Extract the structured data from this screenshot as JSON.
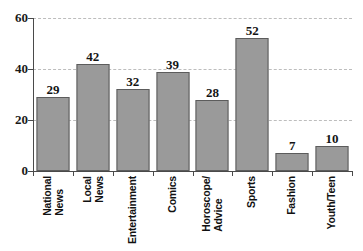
{
  "chart_data": {
    "type": "bar",
    "title": "",
    "subtitle": "",
    "xlabel": "",
    "ylabel": "",
    "ylim": [
      0,
      60
    ],
    "yticks": [
      0,
      20,
      40,
      60
    ],
    "ytick_labels": [
      "0",
      "20",
      "40",
      "60"
    ],
    "grid": true,
    "grid_axis": "y",
    "legend": false,
    "legend_position": "none",
    "orientation": "vertical",
    "value_labels": true,
    "categories": [
      "National News",
      "Local News",
      "Entertainment",
      "Comics",
      "Horoscope/ Advice",
      "Sports",
      "Fashion",
      "Youth/Teen"
    ],
    "category_lines": [
      [
        "National",
        "News"
      ],
      [
        "Local",
        "News"
      ],
      [
        "Entertainment"
      ],
      [
        "Comics"
      ],
      [
        "Horoscope/",
        "Advice"
      ],
      [
        "Sports"
      ],
      [
        "Fashion"
      ],
      [
        "Youth/Teen"
      ]
    ],
    "values": [
      29,
      42,
      32,
      39,
      28,
      52,
      7,
      10
    ],
    "value_label_text": [
      "29",
      "42",
      "32",
      "39",
      "28",
      "52",
      "7",
      "10"
    ],
    "colors": {
      "bar_fill": "#9a9a9a",
      "bar_border": "#5c5c5c",
      "gridline": "#bdbdbd",
      "axis": "#4a4a4a",
      "text": "#141414",
      "background": "#ffffff"
    }
  }
}
